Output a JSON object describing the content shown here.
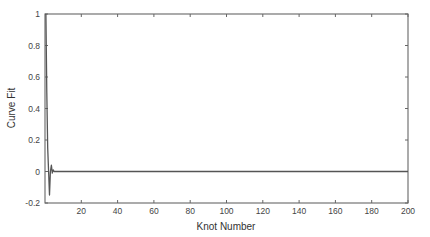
{
  "chart_data": {
    "type": "line",
    "title": "",
    "xlabel": "Knot Number",
    "ylabel": "Curve Fit",
    "xlim": [
      0,
      200
    ],
    "ylim": [
      -0.2,
      1
    ],
    "grid": false,
    "legend": null,
    "x_ticks": [
      20,
      40,
      60,
      80,
      100,
      120,
      140,
      160,
      180,
      200
    ],
    "x_tick_labels": [
      "20",
      "40",
      "60",
      "80",
      "100",
      "120",
      "140",
      "160",
      "180",
      "200"
    ],
    "y_ticks": [
      -0.2,
      0,
      0.2,
      0.4,
      0.6,
      0.8,
      1
    ],
    "y_tick_labels": [
      "-0.2",
      "0",
      "0.2",
      "0.4",
      "0.6",
      "0.8",
      "1"
    ],
    "series": [
      {
        "name": "Curve Fit",
        "color": "#555555",
        "x": [
          0.5,
          1,
          1.5,
          2,
          2.5,
          3,
          3.5,
          4,
          4.5,
          5,
          6,
          10,
          50,
          100,
          150,
          200
        ],
        "values": [
          1.0,
          0.5,
          0.15,
          0.0,
          -0.15,
          0.0,
          0.04,
          -0.01,
          0.01,
          0.0,
          0.0,
          0.0,
          0.0,
          0.0,
          0.0,
          0.0
        ]
      }
    ]
  },
  "axes": {
    "xlabel": "Knot Number",
    "ylabel": "Curve Fit"
  }
}
